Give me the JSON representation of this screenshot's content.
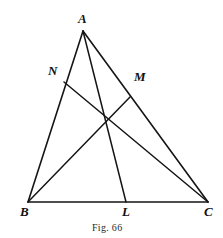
{
  "figure": {
    "caption": "Fig. 66",
    "caption_pos": {
      "x": 92,
      "y": 222
    },
    "background_color": "#ffffff",
    "stroke_color": "#151515",
    "stroke_width": 1.6,
    "canvas": {
      "width": 223,
      "height": 238
    }
  },
  "geometry": {
    "type": "triangle-with-cevians",
    "points": {
      "A": {
        "x": 83,
        "y": 31,
        "label": "A",
        "label_x": 78,
        "label_y": 12
      },
      "B": {
        "x": 28,
        "y": 202,
        "label": "B",
        "label_x": 20,
        "label_y": 205
      },
      "C": {
        "x": 208,
        "y": 202,
        "label": "C",
        "label_x": 204,
        "label_y": 205
      },
      "L": {
        "x": 126,
        "y": 202,
        "label": "L",
        "label_x": 122,
        "label_y": 205
      },
      "M": {
        "x": 130,
        "y": 97,
        "label": "M",
        "label_x": 134,
        "label_y": 70
      },
      "N": {
        "x": 64,
        "y": 82,
        "label": "N",
        "label_x": 48,
        "label_y": 64
      },
      "G": {
        "x": 106,
        "y": 118,
        "label": "",
        "label_x": 0,
        "label_y": 0
      }
    },
    "sides": [
      {
        "name": "side-AB",
        "from": "A",
        "to": "B"
      },
      {
        "name": "side-AC",
        "from": "A",
        "to": "C"
      },
      {
        "name": "side-BC",
        "from": "B",
        "to": "C"
      }
    ],
    "cevians": [
      {
        "name": "cevian-AL",
        "from": "A",
        "to": "L"
      },
      {
        "name": "cevian-BM",
        "from": "B",
        "to": "M"
      },
      {
        "name": "cevian-NC",
        "from": "N",
        "to": "C"
      }
    ],
    "labels_order": [
      "A",
      "N",
      "M",
      "B",
      "L",
      "C"
    ]
  }
}
